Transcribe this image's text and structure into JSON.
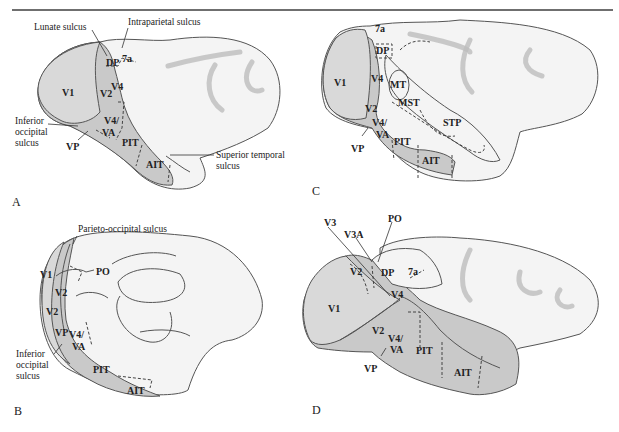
{
  "figure": {
    "colors": {
      "visual_area_fill": "#c9c9c9",
      "cortex_fill": "#f4f4f4",
      "outline": "#555555",
      "rule": "#6f6f6f"
    }
  },
  "panels": {
    "A": {
      "letter": "A",
      "areas": [
        "V1",
        "V2",
        "V4",
        "DP",
        "7a",
        "V4/",
        "VA",
        "VP",
        "PIT",
        "AIT"
      ],
      "callouts": {
        "lunate": "Lunate sulcus",
        "intraparietal": "Intraparietal sulcus",
        "inferior_occipital_1": "Inferior",
        "inferior_occipital_2": "occipital",
        "inferior_occipital_3": "sulcus",
        "superior_temporal_1": "Superior temporal",
        "superior_temporal_2": "sulcus"
      }
    },
    "B": {
      "letter": "B",
      "areas": [
        "V1",
        "PO",
        "V2",
        "V2",
        "VP",
        "V4/",
        "VA",
        "PIT",
        "AIT"
      ],
      "callouts": {
        "parieto_occipital": "Parieto-occipital sulcus",
        "inferior_occipital_1": "Inferior",
        "inferior_occipital_2": "occipital",
        "inferior_occipital_3": "sulcus"
      }
    },
    "C": {
      "letter": "C",
      "areas": [
        "7a",
        "DP",
        "V1",
        "V4",
        "MT",
        "MST",
        "V2",
        "V4/",
        "VA",
        "STP",
        "PIT",
        "VP",
        "AIT"
      ]
    },
    "D": {
      "letter": "D",
      "areas": [
        "V3",
        "V3A",
        "PO",
        "V2",
        "DP",
        "7a",
        "V1",
        "V4",
        "V2",
        "V4/",
        "VA",
        "PIT",
        "VP",
        "AIT"
      ]
    }
  }
}
